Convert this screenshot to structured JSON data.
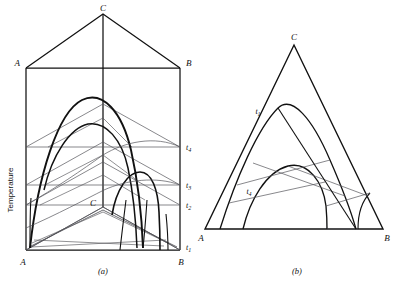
{
  "figure": {
    "type": "ternary-phase-diagram",
    "axis_label_vertical": "Temperature"
  },
  "panel_a": {
    "caption": "(a)",
    "vertices": {
      "A_top": "A",
      "B_top": "B",
      "C_top": "C",
      "A_base": "A",
      "B_base": "B",
      "C_base": "C"
    },
    "isotherms": [
      {
        "id": "t1",
        "label": "t",
        "sub": "1"
      },
      {
        "id": "t2",
        "label": "t",
        "sub": "2"
      },
      {
        "id": "t3",
        "label": "t",
        "sub": "3"
      },
      {
        "id": "t4",
        "label": "t",
        "sub": "4"
      }
    ]
  },
  "panel_b": {
    "caption": "(b)",
    "vertices": {
      "A": "A",
      "B": "B",
      "C": "C"
    },
    "isotherms": [
      {
        "id": "t1",
        "label": "t",
        "sub": "1"
      },
      {
        "id": "t4",
        "label": "t",
        "sub": "4"
      }
    ]
  },
  "colors": {
    "ink": "#111111",
    "thin": "#55555a",
    "background": "#ffffff"
  }
}
